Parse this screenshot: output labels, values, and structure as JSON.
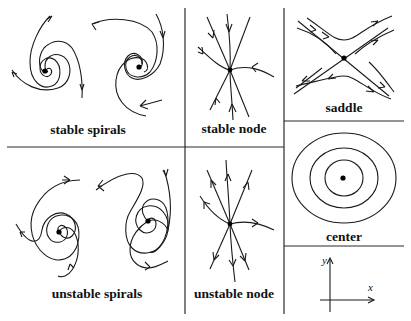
{
  "figure": {
    "panels": [
      {
        "id": "stable-spirals",
        "label": "stable spirals",
        "fixed_points": [
          {
            "x": 45,
            "y": 71
          },
          {
            "x": 139,
            "y": 67
          }
        ],
        "flow": "inward"
      },
      {
        "id": "stable-node",
        "label": "stable node",
        "fixed_points": [
          {
            "x": 230,
            "y": 70
          }
        ],
        "flow": "inward"
      },
      {
        "id": "saddle",
        "label": "saddle",
        "fixed_points": [
          {
            "x": 344,
            "y": 58
          }
        ],
        "flow": "in along one diagonal, out along the other"
      },
      {
        "id": "center",
        "label": "center",
        "fixed_points": [
          {
            "x": 343,
            "y": 178
          }
        ],
        "flow": "closed orbits"
      },
      {
        "id": "unstable-spirals",
        "label": "unstable spirals",
        "fixed_points": [
          {
            "x": 59,
            "y": 232
          },
          {
            "x": 148,
            "y": 221
          }
        ],
        "flow": "outward"
      },
      {
        "id": "unstable-node",
        "label": "unstable node",
        "fixed_points": [
          {
            "x": 230,
            "y": 224
          }
        ],
        "flow": "outward"
      }
    ],
    "axes_legend": {
      "x_label": "x",
      "y_label": "y"
    },
    "colors": {
      "ink": "#1a1a1a",
      "background": "#ffffff"
    }
  }
}
